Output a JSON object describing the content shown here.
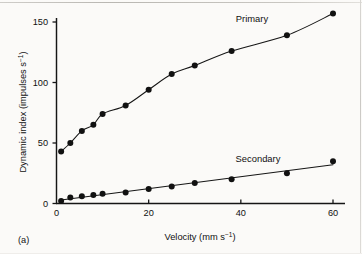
{
  "figure": {
    "panel_label": "(a)",
    "background_color": "#fbfaf8",
    "ink_color": "#111111"
  },
  "axes": {
    "x": {
      "label_main": "Velocity (mm s",
      "label_sup": "−1",
      "label_tail": ")",
      "label_full": "Velocity (mm s⁻¹)",
      "ticks": [
        "0",
        "20",
        "40",
        "60"
      ],
      "tick_values": [
        0,
        20,
        40,
        60
      ],
      "range": [
        0,
        63
      ]
    },
    "y": {
      "label_main": "Dynamic index (impulses s",
      "label_sup": "−1",
      "label_tail": ")",
      "label_full": "Dynamic index (impulses s⁻¹)",
      "ticks": [
        "0",
        "50",
        "100",
        "150"
      ],
      "tick_values": [
        0,
        50,
        100,
        150
      ],
      "range": [
        0,
        160
      ]
    }
  },
  "annotations": {
    "primary_label": "Primary",
    "secondary_label": "Secondary"
  },
  "chart_data": {
    "type": "scatter",
    "title": "",
    "subtitle": "",
    "xlabel": "Velocity (mm s⁻¹)",
    "ylabel": "Dynamic index (impulses s⁻¹)",
    "xlim": [
      0,
      63
    ],
    "ylim": [
      0,
      160
    ],
    "xticks": [
      0,
      20,
      40,
      60
    ],
    "yticks": [
      0,
      50,
      100,
      150
    ],
    "grid": false,
    "legend": "inline-annotations",
    "marker": "filled-circle",
    "series": [
      {
        "name": "Primary",
        "label_position": {
          "x": 40,
          "y": 150
        },
        "fit": "saturating-curve",
        "points": [
          {
            "x": 1.0,
            "y": 43
          },
          {
            "x": 3.0,
            "y": 50
          },
          {
            "x": 5.5,
            "y": 60
          },
          {
            "x": 8.0,
            "y": 65
          },
          {
            "x": 10.0,
            "y": 74
          },
          {
            "x": 15.0,
            "y": 81
          },
          {
            "x": 20.0,
            "y": 94
          },
          {
            "x": 25.0,
            "y": 107
          },
          {
            "x": 30.0,
            "y": 114
          },
          {
            "x": 38.0,
            "y": 126
          },
          {
            "x": 50.0,
            "y": 139
          },
          {
            "x": 60.0,
            "y": 157
          }
        ]
      },
      {
        "name": "Secondary",
        "label_position": {
          "x": 40,
          "y": 43
        },
        "fit": "near-linear",
        "points": [
          {
            "x": 1.0,
            "y": 2
          },
          {
            "x": 3.0,
            "y": 5
          },
          {
            "x": 5.5,
            "y": 6
          },
          {
            "x": 8.0,
            "y": 7
          },
          {
            "x": 10.0,
            "y": 8
          },
          {
            "x": 15.0,
            "y": 9
          },
          {
            "x": 20.0,
            "y": 12
          },
          {
            "x": 25.0,
            "y": 14
          },
          {
            "x": 30.0,
            "y": 17
          },
          {
            "x": 38.0,
            "y": 20
          },
          {
            "x": 50.0,
            "y": 25
          },
          {
            "x": 60.0,
            "y": 35
          }
        ]
      }
    ]
  }
}
